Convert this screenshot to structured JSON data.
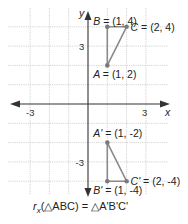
{
  "chart_data": {
    "type": "scatter",
    "title": "",
    "xlabel": "x",
    "ylabel": "y",
    "xlim": [
      -4,
      4
    ],
    "ylim": [
      -4.5,
      5
    ],
    "grid": true,
    "x_ticks": [
      {
        "value": -3,
        "label": "-3"
      },
      {
        "value": 3,
        "label": "3"
      }
    ],
    "y_ticks": [
      {
        "value": 3,
        "label": "3"
      },
      {
        "value": -3,
        "label": "-3"
      }
    ],
    "series": [
      {
        "name": "ABC",
        "closed": true,
        "points": [
          {
            "name": "A",
            "x": 1,
            "y": 2,
            "label": "A = (1, 2)",
            "label_pos": "below"
          },
          {
            "name": "B",
            "x": 1,
            "y": 4,
            "label": "B = (1, 4)",
            "label_pos": "above"
          },
          {
            "name": "C",
            "x": 2,
            "y": 4,
            "label": "C = (2, 4)",
            "label_pos": "right"
          }
        ]
      },
      {
        "name": "A'B'C'",
        "closed": true,
        "points": [
          {
            "name": "A'",
            "x": 1,
            "y": -2,
            "label": "A' = (1, -2)",
            "label_pos": "above"
          },
          {
            "name": "B'",
            "x": 1,
            "y": -4,
            "label": "B' = (1, -4)",
            "label_pos": "below"
          },
          {
            "name": "C'",
            "x": 2,
            "y": -4,
            "label": "C' = (2, -4)",
            "label_pos": "right"
          }
        ]
      }
    ],
    "annotations": [
      {
        "text": "rx(△ABC) = △A'B'C'",
        "subscript_text": "r",
        "subscript": "x",
        "rest": "(△ABC) = △A'B'C'",
        "position": "bottom"
      }
    ]
  }
}
